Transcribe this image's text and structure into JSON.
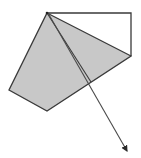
{
  "diagram": {
    "width": 141,
    "height": 158,
    "colors": {
      "background": "#ffffff",
      "fill": "#c8c8c8",
      "stroke": "#3a3a3a",
      "arrow": "#4a4a4a"
    },
    "vertices": {
      "top": [
        47,
        13
      ],
      "top_right": [
        131,
        13
      ],
      "right": [
        131,
        56
      ],
      "bottom": [
        47,
        111
      ],
      "left": [
        9,
        90
      ],
      "inner": [
        91,
        82
      ],
      "arrow_tip": [
        128,
        154
      ]
    },
    "shapes": [
      {
        "id": "shaded-pentagon",
        "type": "polygon",
        "points": "47,13 131,56 47,111 9,90",
        "filled": true
      },
      {
        "id": "top-triangle",
        "type": "polygon",
        "points": "47,13 131,13 131,56",
        "filled": false
      },
      {
        "id": "inner-line",
        "type": "line",
        "from": [
          47,
          13
        ],
        "to": [
          91,
          82
        ]
      },
      {
        "id": "arrow-vector",
        "type": "arrow",
        "from": [
          47,
          13
        ],
        "to": [
          128,
          154
        ]
      }
    ]
  }
}
